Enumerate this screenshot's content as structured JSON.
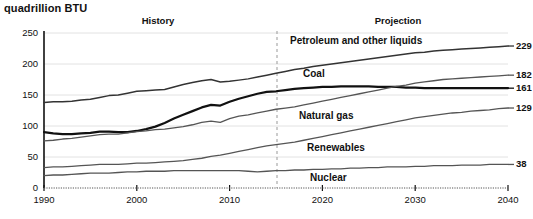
{
  "chart_data": {
    "type": "line",
    "title": "",
    "ylabel": "quadrillion BTU",
    "xlabel": "",
    "ylim": [
      0,
      250
    ],
    "xlim": [
      1990,
      2040
    ],
    "yticks": [
      0,
      50,
      100,
      150,
      200,
      250
    ],
    "xticks": [
      1990,
      2000,
      2010,
      2020,
      2030,
      2040
    ],
    "grid": true,
    "legend": "inline-labels",
    "annotations": {
      "history_label": "History",
      "projection_label": "Projection",
      "divider_year": 2017
    },
    "x": [
      1990,
      1991,
      1992,
      1993,
      1994,
      1995,
      1996,
      1997,
      1998,
      1999,
      2000,
      2001,
      2002,
      2003,
      2004,
      2005,
      2006,
      2007,
      2008,
      2009,
      2010,
      2011,
      2012,
      2013,
      2014,
      2015,
      2016,
      2017,
      2018,
      2019,
      2020,
      2021,
      2022,
      2023,
      2024,
      2025,
      2026,
      2027,
      2028,
      2029,
      2030,
      2031,
      2032,
      2033,
      2034,
      2035,
      2036,
      2037,
      2038,
      2039,
      2040
    ],
    "series": [
      {
        "name": "Petroleum and other liquids",
        "end_value": 229,
        "color": "#333333",
        "values": [
          138,
          139,
          139,
          140,
          142,
          143,
          146,
          149,
          150,
          153,
          156,
          157,
          158,
          159,
          163,
          167,
          170,
          173,
          175,
          171,
          172,
          174,
          176,
          179,
          182,
          185,
          188,
          191,
          193,
          196,
          198,
          200,
          202,
          204,
          206,
          208,
          210,
          212,
          214,
          216,
          218,
          219,
          221,
          222,
          223,
          224,
          225,
          226,
          227,
          228,
          229
        ]
      },
      {
        "name": "Coal",
        "end_value": 161,
        "color": "#111111",
        "values": [
          90,
          88,
          87,
          87,
          88,
          89,
          91,
          91,
          90,
          90,
          92,
          95,
          99,
          105,
          112,
          118,
          124,
          130,
          134,
          133,
          139,
          144,
          148,
          152,
          155,
          156,
          158,
          160,
          161,
          162,
          163,
          163,
          164,
          164,
          164,
          164,
          163,
          163,
          163,
          162,
          162,
          161,
          161,
          161,
          161,
          161,
          161,
          161,
          161,
          161,
          161
        ]
      },
      {
        "name": "Natural gas",
        "end_value": 182,
        "color": "#555555",
        "values": [
          76,
          77,
          79,
          80,
          82,
          84,
          86,
          87,
          87,
          89,
          91,
          92,
          94,
          95,
          97,
          99,
          102,
          106,
          108,
          106,
          112,
          116,
          118,
          121,
          124,
          127,
          129,
          131,
          134,
          137,
          140,
          143,
          146,
          149,
          152,
          155,
          158,
          161,
          164,
          166,
          169,
          171,
          173,
          175,
          176,
          177,
          178,
          179,
          180,
          181,
          182
        ]
      },
      {
        "name": "Renewables",
        "end_value": 129,
        "color": "#555555",
        "values": [
          33,
          34,
          34,
          35,
          36,
          37,
          38,
          38,
          38,
          39,
          40,
          40,
          41,
          42,
          43,
          44,
          46,
          48,
          51,
          53,
          56,
          59,
          62,
          65,
          68,
          70,
          72,
          74,
          77,
          80,
          83,
          86,
          89,
          92,
          95,
          98,
          101,
          104,
          107,
          110,
          113,
          115,
          117,
          119,
          121,
          122,
          124,
          125,
          126,
          128,
          129
        ]
      },
      {
        "name": "Nuclear",
        "end_value": 38,
        "color": "#555555",
        "values": [
          20,
          21,
          21,
          22,
          23,
          24,
          24,
          24,
          25,
          26,
          26,
          27,
          27,
          27,
          28,
          28,
          28,
          28,
          28,
          28,
          28,
          28,
          27,
          26,
          27,
          28,
          28,
          29,
          29,
          30,
          30,
          31,
          31,
          32,
          32,
          33,
          33,
          34,
          34,
          34,
          35,
          35,
          36,
          36,
          36,
          37,
          37,
          37,
          38,
          38,
          38
        ]
      }
    ]
  },
  "labels": {
    "unit": "quadrillion BTU",
    "history": "History",
    "projection": "Projection",
    "series_inline": [
      "Petroleum and other liquids",
      "Coal",
      "Natural gas",
      "Renewables",
      "Nuclear"
    ],
    "end_values": [
      "229",
      "182",
      "161",
      "129",
      "38"
    ],
    "yticks": [
      "250",
      "200",
      "150",
      "100",
      "50",
      "0"
    ],
    "xticks": [
      "1990",
      "2000",
      "2010",
      "2020",
      "2030",
      "2040"
    ]
  }
}
